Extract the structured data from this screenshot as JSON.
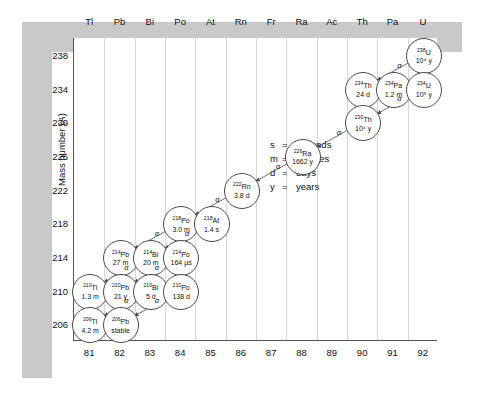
{
  "axes": {
    "x_label_text": "Atomic number (Z)",
    "x_label_prefix": "Atomic number (",
    "x_label_var": "Z",
    "x_label_suffix": ")",
    "y_label_text": "Mass number (A)",
    "y_label_prefix": "Mass number (",
    "y_label_var": "A",
    "y_label_suffix": ")",
    "x_ticks": [
      81,
      82,
      83,
      84,
      85,
      86,
      87,
      88,
      89,
      90,
      91,
      92
    ],
    "y_ticks": [
      238,
      234,
      230,
      226,
      222,
      218,
      214,
      210,
      206
    ],
    "x_range": [
      80.5,
      92.5
    ],
    "y_range": [
      204,
      240
    ]
  },
  "element_headers": [
    "Tl",
    "Pb",
    "Bi",
    "Po",
    "At",
    "Rn",
    "Fr",
    "Ra",
    "Ac",
    "Th",
    "Pa",
    "U"
  ],
  "legend": [
    {
      "symbol": "s",
      "eq": "=",
      "meaning": "seconds"
    },
    {
      "symbol": "m",
      "eq": "=",
      "meaning": "minutes"
    },
    {
      "symbol": "d",
      "eq": "=",
      "meaning": "days"
    },
    {
      "symbol": "y",
      "eq": "=",
      "meaning": "years"
    }
  ],
  "chart_data": {
    "type": "scatter",
    "xlabel": "Atomic number (Z)",
    "ylabel": "Mass number (A)",
    "xlim": [
      80.5,
      92.5
    ],
    "ylim": [
      204,
      240
    ],
    "grid": "vertical",
    "nuclides": [
      {
        "id": "U238",
        "element": "U",
        "z": 92,
        "a": 238,
        "isotope": "238U",
        "half_life": "10⁹ y"
      },
      {
        "id": "Th234",
        "element": "Th",
        "z": 90,
        "a": 234,
        "isotope": "234Th",
        "half_life": "24 d"
      },
      {
        "id": "Pa234",
        "element": "Pa",
        "z": 91,
        "a": 234,
        "isotope": "234Pa",
        "half_life": "1.2 m"
      },
      {
        "id": "U234",
        "element": "U",
        "z": 92,
        "a": 234,
        "isotope": "234U",
        "half_life": "10⁵ y"
      },
      {
        "id": "Th230",
        "element": "Th",
        "z": 90,
        "a": 230,
        "isotope": "230Th",
        "half_life": "10⁴ y"
      },
      {
        "id": "Ra226",
        "element": "Ra",
        "z": 88,
        "a": 226,
        "isotope": "226Ra",
        "half_life": "1662 y"
      },
      {
        "id": "Rn222",
        "element": "Rn",
        "z": 86,
        "a": 222,
        "isotope": "222Rn",
        "half_life": "3.8 d"
      },
      {
        "id": "Po218",
        "element": "Po",
        "z": 84,
        "a": 218,
        "isotope": "218Po",
        "half_life": "3.0 m"
      },
      {
        "id": "At218",
        "element": "At",
        "z": 85,
        "a": 218,
        "isotope": "218At",
        "half_life": "1.4 s"
      },
      {
        "id": "Pb214",
        "element": "Pb",
        "z": 82,
        "a": 214,
        "isotope": "214Pb",
        "half_life": "27 m"
      },
      {
        "id": "Bi214",
        "element": "Bi",
        "z": 83,
        "a": 214,
        "isotope": "214Bi",
        "half_life": "20 m"
      },
      {
        "id": "Po214",
        "element": "Po",
        "z": 84,
        "a": 214,
        "isotope": "214Po",
        "half_life": "164 µs"
      },
      {
        "id": "Tl210",
        "element": "Tl",
        "z": 81,
        "a": 210,
        "isotope": "210Tl",
        "half_life": "1.3 m"
      },
      {
        "id": "Pb210",
        "element": "Pb",
        "z": 82,
        "a": 210,
        "isotope": "210Pb",
        "half_life": "21 y"
      },
      {
        "id": "Bi210",
        "element": "Bi",
        "z": 83,
        "a": 210,
        "isotope": "210Bi",
        "half_life": "5 d"
      },
      {
        "id": "Po210",
        "element": "Po",
        "z": 84,
        "a": 210,
        "isotope": "210Po",
        "half_life": "138 d"
      },
      {
        "id": "Tl206",
        "element": "Tl",
        "z": 81,
        "a": 206,
        "isotope": "206Tl",
        "half_life": "4.2 m"
      },
      {
        "id": "Pb206",
        "element": "Pb",
        "z": 82,
        "a": 206,
        "isotope": "206Pb",
        "half_life": "stable"
      }
    ],
    "decays": [
      {
        "from": "U238",
        "to": "Th234",
        "mode": "α",
        "show_label": true
      },
      {
        "from": "Th234",
        "to": "Pa234",
        "mode": "β",
        "show_label": false
      },
      {
        "from": "Pa234",
        "to": "U234",
        "mode": "β",
        "show_label": false
      },
      {
        "from": "U234",
        "to": "Th230",
        "mode": "α",
        "show_label": true
      },
      {
        "from": "Th230",
        "to": "Ra226",
        "mode": "α",
        "show_label": true
      },
      {
        "from": "Ra226",
        "to": "Rn222",
        "mode": "α",
        "show_label": true
      },
      {
        "from": "Rn222",
        "to": "Po218",
        "mode": "α",
        "show_label": true
      },
      {
        "from": "Po218",
        "to": "At218",
        "mode": "β",
        "show_label": false
      },
      {
        "from": "At218",
        "to": "Bi214",
        "mode": "α",
        "show_label": true
      },
      {
        "from": "Po218",
        "to": "Pb214",
        "mode": "α",
        "show_label": true
      },
      {
        "from": "Pb214",
        "to": "Bi214",
        "mode": "β",
        "show_label": false
      },
      {
        "from": "Bi214",
        "to": "Po214",
        "mode": "β",
        "show_label": false
      },
      {
        "from": "Bi214",
        "to": "Tl210",
        "mode": "α",
        "show_label": true
      },
      {
        "from": "Po214",
        "to": "Pb210",
        "mode": "α",
        "show_label": true
      },
      {
        "from": "Tl210",
        "to": "Pb210",
        "mode": "β",
        "show_label": false
      },
      {
        "from": "Pb210",
        "to": "Bi210",
        "mode": "β",
        "show_label": false
      },
      {
        "from": "Bi210",
        "to": "Po210",
        "mode": "β",
        "show_label": false
      },
      {
        "from": "Bi210",
        "to": "Tl206",
        "mode": "α",
        "show_label": true
      },
      {
        "from": "Po210",
        "to": "Pb206",
        "mode": "α",
        "show_label": true
      },
      {
        "from": "Tl206",
        "to": "Pb206",
        "mode": "β",
        "show_label": false
      }
    ]
  },
  "colors": {
    "mat": "#c9c9c9",
    "plot_bg": "#ffffff",
    "grid": "#d8d8d8",
    "axis": "#555555",
    "circle_stroke": "#4a4a4a",
    "text": "#111111"
  }
}
